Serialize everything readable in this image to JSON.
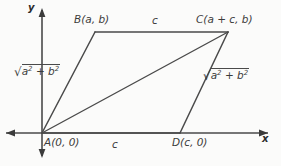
{
  "figure": {
    "type": "coordinate-geometry-diagram",
    "background_color": "#fbfbfa",
    "line_color": "#4a4a4a",
    "text_color": "#3b3b3b"
  },
  "axes": {
    "x_label": "x",
    "y_label": "y",
    "origin_pixel": [
      42,
      133
    ],
    "x_axis_pixel": {
      "x1": 4,
      "y1": 133,
      "x2": 272,
      "y2": 133
    },
    "y_axis_pixel": {
      "x1": 42,
      "y1": 8,
      "x2": 42,
      "y2": 158
    },
    "arrowheads": [
      "left",
      "right",
      "up",
      "down"
    ]
  },
  "vertices": [
    {
      "name": "A",
      "label": "A(0, 0)",
      "coord_text": "(0, 0)",
      "pixel": [
        42,
        133
      ]
    },
    {
      "name": "B",
      "label": "B(a, b)",
      "coord_text": "(a, b)",
      "pixel": [
        95,
        32
      ]
    },
    {
      "name": "C",
      "label": "C(a + c, b)",
      "coord_text": "(a + c, b)",
      "pixel": [
        228,
        32
      ]
    },
    {
      "name": "D",
      "label": "D(c, 0)",
      "coord_text": "(c, 0)",
      "pixel": [
        180,
        133
      ]
    }
  ],
  "edges": [
    {
      "name": "AB",
      "from": "A",
      "to": "B",
      "label_parts": {
        "radicand": "a",
        "plus": "+",
        "second": "b"
      }
    },
    {
      "name": "BC",
      "from": "B",
      "to": "C",
      "label": "c"
    },
    {
      "name": "DC",
      "from": "D",
      "to": "C",
      "label_parts": {
        "radicand": "a",
        "plus": "+",
        "second": "b"
      }
    },
    {
      "name": "AD",
      "from": "A",
      "to": "D",
      "label": "c"
    },
    {
      "name": "AC",
      "from": "A",
      "to": "C",
      "label": ""
    }
  ],
  "labels": {
    "side_top": "c",
    "side_bottom": "c",
    "radical_left": {
      "base1": "a",
      "exp1": "2",
      "operator": "+",
      "base2": "b",
      "exp2": "2",
      "sign": "√"
    },
    "radical_right": {
      "base1": "a",
      "exp1": "2",
      "operator": "+",
      "base2": "b",
      "exp2": "2",
      "sign": "√"
    }
  }
}
